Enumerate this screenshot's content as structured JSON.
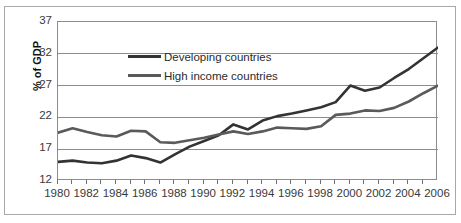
{
  "chart_data": {
    "type": "line",
    "title": "",
    "xlabel": "",
    "ylabel": "% of GDP",
    "xlim": [
      1980,
      2006
    ],
    "ylim": [
      12,
      37
    ],
    "yticks": [
      12,
      17,
      22,
      27,
      32,
      37
    ],
    "grid": true,
    "grid_axis": "y",
    "legend_position": "upper left inside plot",
    "x": [
      1980,
      1981,
      1982,
      1983,
      1984,
      1985,
      1986,
      1987,
      1988,
      1989,
      1990,
      1991,
      1992,
      1993,
      1994,
      1995,
      1996,
      1997,
      1998,
      1999,
      2000,
      2001,
      2002,
      2003,
      2004,
      2005,
      2006
    ],
    "xtick_labels": [
      "1980",
      "1982",
      "1984",
      "1986",
      "1988",
      "1990",
      "1992",
      "1994",
      "1996",
      "1998",
      "2000",
      "2002",
      "2004",
      "2006"
    ],
    "series": [
      {
        "name": "Developing countries",
        "color": "#333333",
        "values": [
          15.0,
          15.2,
          14.9,
          14.8,
          15.2,
          16.0,
          15.6,
          14.9,
          16.2,
          17.4,
          18.3,
          19.2,
          20.9,
          20.1,
          21.5,
          22.2,
          22.6,
          23.1,
          23.6,
          24.4,
          27.0,
          26.2,
          26.7,
          28.2,
          29.6,
          31.3,
          33.0
        ]
      },
      {
        "name": "High income countries",
        "color": "#5a5a5a",
        "values": [
          19.6,
          20.3,
          19.7,
          19.2,
          19.0,
          19.9,
          19.8,
          18.1,
          18.0,
          18.4,
          18.8,
          19.3,
          19.8,
          19.4,
          19.8,
          20.4,
          20.3,
          20.2,
          20.6,
          22.4,
          22.6,
          23.1,
          23.0,
          23.5,
          24.5,
          25.8,
          27.0
        ]
      }
    ]
  },
  "legend": {
    "items": [
      {
        "label": "Developing countries",
        "color": "#333333"
      },
      {
        "label": "High income countries",
        "color": "#5a5a5a"
      }
    ]
  },
  "axis": {
    "y_title": "% of GDP",
    "y_tick_labels": [
      "37",
      "32",
      "27",
      "22",
      "17",
      "12"
    ]
  }
}
